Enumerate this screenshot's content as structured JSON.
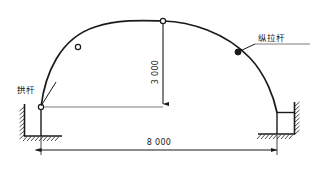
{
  "diagram": {
    "labels": [
      {
        "id": "arch-bar",
        "text": "拱杆",
        "x": 17,
        "y": 93
      },
      {
        "id": "tie-bar",
        "text": "纵拉杆",
        "x": 258,
        "y": 46
      }
    ],
    "dimensions": [
      {
        "id": "height",
        "text": "3 000",
        "orientation": "vertical",
        "x": 158,
        "y": 72
      },
      {
        "id": "span",
        "text": "8 000",
        "orientation": "horizontal",
        "x": 159,
        "y": 143
      }
    ],
    "nodes": [
      {
        "id": "left-spring-node",
        "type": "hollow",
        "x": 41,
        "y": 107
      },
      {
        "id": "left-arch-node",
        "type": "hollow",
        "x": 78,
        "y": 47
      },
      {
        "id": "crown-node",
        "type": "hollow",
        "x": 163,
        "y": 21
      },
      {
        "id": "right-tie-node",
        "type": "solid",
        "x": 238,
        "y": 52
      }
    ],
    "colors": {
      "line": "#1a1a1a",
      "tie_line": "#7d7d7d",
      "background": "#ffffff"
    }
  }
}
